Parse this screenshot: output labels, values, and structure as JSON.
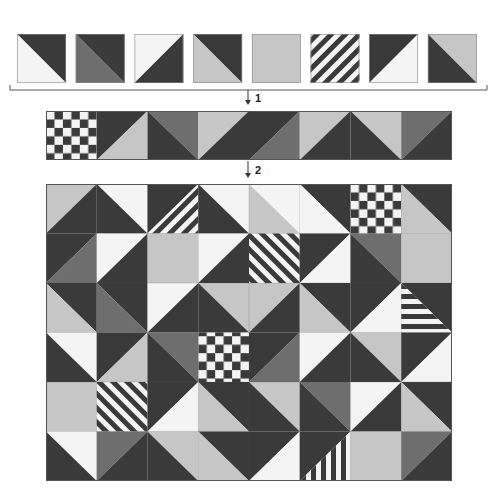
{
  "colors": {
    "dark": "#3a3a3a",
    "mid": "#6e6e6e",
    "light": "#c6c6c6",
    "white": "#f4f4f4",
    "outline": "#8a8a8a",
    "line": "#555555"
  },
  "steps": [
    {
      "label": "1"
    },
    {
      "label": "2"
    }
  ],
  "swatches": [
    {
      "kind": "split",
      "diag": "tl-br",
      "a": "dark",
      "b": "white"
    },
    {
      "kind": "split",
      "diag": "tl-br",
      "a": "dark",
      "b": "mid"
    },
    {
      "kind": "split",
      "diag": "tr-bl",
      "a": "white",
      "b": "dark"
    },
    {
      "kind": "split",
      "diag": "tl-br",
      "a": "dark",
      "b": "light"
    },
    {
      "kind": "solid",
      "a": "light"
    },
    {
      "kind": "stripe",
      "dir": "diag-up",
      "a": "dark",
      "b": "white"
    },
    {
      "kind": "split",
      "diag": "tr-bl",
      "a": "dark",
      "b": "white"
    },
    {
      "kind": "split",
      "diag": "tl-br",
      "a": "light",
      "b": "dark"
    }
  ],
  "strip": [
    {
      "kind": "checker",
      "a": "dark",
      "b": "white"
    },
    {
      "kind": "split",
      "diag": "tr-bl",
      "a": "dark",
      "b": "light"
    },
    {
      "kind": "split",
      "diag": "tl-br",
      "a": "mid",
      "b": "dark"
    },
    {
      "kind": "split",
      "diag": "tr-bl",
      "a": "light",
      "b": "dark"
    },
    {
      "kind": "split",
      "diag": "tr-bl",
      "a": "dark",
      "b": "mid"
    },
    {
      "kind": "split",
      "diag": "tr-bl",
      "a": "light",
      "b": "dark"
    },
    {
      "kind": "split",
      "diag": "tl-br",
      "a": "light",
      "b": "dark"
    },
    {
      "kind": "split",
      "diag": "tr-bl",
      "a": "mid",
      "b": "dark"
    }
  ],
  "grid": {
    "cols": 8,
    "rows": 6,
    "cells": [
      [
        {
          "kind": "split",
          "diag": "tr-bl",
          "a": "light",
          "b": "dark"
        },
        {
          "kind": "split",
          "diag": "tl-br",
          "a": "white",
          "b": "dark"
        },
        {
          "kind": "stripe-half",
          "diag": "tr-bl",
          "a": "dark",
          "stripe": "diag-up"
        },
        {
          "kind": "split",
          "diag": "tl-br",
          "a": "white",
          "b": "dark"
        },
        {
          "kind": "split",
          "diag": "tl-br",
          "a": "white",
          "b": "light"
        },
        {
          "kind": "split",
          "diag": "tl-br",
          "a": "dark",
          "b": "white"
        },
        {
          "kind": "checker",
          "a": "dark",
          "b": "white"
        },
        {
          "kind": "split",
          "diag": "tl-br",
          "a": "dark",
          "b": "light"
        }
      ],
      [
        {
          "kind": "split",
          "diag": "tr-bl",
          "a": "dark",
          "b": "mid"
        },
        {
          "kind": "split",
          "diag": "tr-bl",
          "a": "white",
          "b": "dark"
        },
        {
          "kind": "solid",
          "a": "light"
        },
        {
          "kind": "split",
          "diag": "tr-bl",
          "a": "white",
          "b": "dark"
        },
        {
          "kind": "stripe",
          "dir": "diag-down",
          "a": "dark",
          "b": "white"
        },
        {
          "kind": "split",
          "diag": "tr-bl",
          "a": "dark",
          "b": "white"
        },
        {
          "kind": "split",
          "diag": "tl-br",
          "a": "mid",
          "b": "dark"
        },
        {
          "kind": "solid",
          "a": "light"
        }
      ],
      [
        {
          "kind": "split",
          "diag": "tl-br",
          "a": "dark",
          "b": "light"
        },
        {
          "kind": "split",
          "diag": "tl-br",
          "a": "dark",
          "b": "mid"
        },
        {
          "kind": "split",
          "diag": "tr-bl",
          "a": "white",
          "b": "dark"
        },
        {
          "kind": "split",
          "diag": "tl-br",
          "a": "light",
          "b": "dark"
        },
        {
          "kind": "split",
          "diag": "tr-bl",
          "a": "light",
          "b": "dark"
        },
        {
          "kind": "split",
          "diag": "tl-br",
          "a": "dark",
          "b": "light"
        },
        {
          "kind": "split",
          "diag": "tr-bl",
          "a": "dark",
          "b": "white"
        },
        {
          "kind": "stripe-half",
          "diag": "tl-br",
          "a": "dark",
          "stripe": "horizontal"
        }
      ],
      [
        {
          "kind": "split",
          "diag": "tl-br",
          "a": "white",
          "b": "dark"
        },
        {
          "kind": "split",
          "diag": "tr-bl",
          "a": "dark",
          "b": "light"
        },
        {
          "kind": "split",
          "diag": "tl-br",
          "a": "mid",
          "b": "dark"
        },
        {
          "kind": "checker",
          "a": "dark",
          "b": "white"
        },
        {
          "kind": "split",
          "diag": "tr-bl",
          "a": "dark",
          "b": "mid"
        },
        {
          "kind": "split",
          "diag": "tr-bl",
          "a": "white",
          "b": "dark"
        },
        {
          "kind": "split",
          "diag": "tl-br",
          "a": "light",
          "b": "dark"
        },
        {
          "kind": "split",
          "diag": "tr-bl",
          "a": "dark",
          "b": "white"
        }
      ],
      [
        {
          "kind": "solid",
          "a": "light"
        },
        {
          "kind": "stripe",
          "dir": "diag-down",
          "a": "dark",
          "b": "white"
        },
        {
          "kind": "split",
          "diag": "tr-bl",
          "a": "dark",
          "b": "white"
        },
        {
          "kind": "split",
          "diag": "tl-br",
          "a": "dark",
          "b": "light"
        },
        {
          "kind": "split",
          "diag": "tl-br",
          "a": "light",
          "b": "dark"
        },
        {
          "kind": "split",
          "diag": "tl-br",
          "a": "mid",
          "b": "dark"
        },
        {
          "kind": "split",
          "diag": "tr-bl",
          "a": "white",
          "b": "dark"
        },
        {
          "kind": "split",
          "diag": "tl-br",
          "a": "dark",
          "b": "light"
        }
      ],
      [
        {
          "kind": "split",
          "diag": "tl-br",
          "a": "white",
          "b": "dark"
        },
        {
          "kind": "split",
          "diag": "tr-bl",
          "a": "mid",
          "b": "dark"
        },
        {
          "kind": "split",
          "diag": "tl-br",
          "a": "light",
          "b": "dark"
        },
        {
          "kind": "split",
          "diag": "tl-br",
          "a": "dark",
          "b": "light"
        },
        {
          "kind": "split",
          "diag": "tr-bl",
          "a": "dark",
          "b": "white"
        },
        {
          "kind": "stripe-half",
          "diag": "tr-bl",
          "a": "dark",
          "stripe": "vertical"
        },
        {
          "kind": "solid",
          "a": "light"
        },
        {
          "kind": "split",
          "diag": "tr-bl",
          "a": "mid",
          "b": "dark"
        }
      ]
    ]
  }
}
